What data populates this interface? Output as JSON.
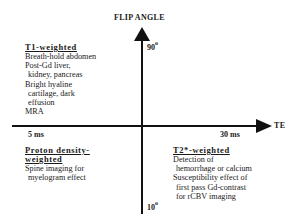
{
  "diagram": {
    "y_axis": {
      "label": "FLIP ANGLE",
      "top_tick": "90",
      "bottom_tick": "10",
      "tick_unit": "o"
    },
    "x_axis": {
      "label": "TE",
      "left_tick": "5 ms",
      "right_tick": "30 ms"
    },
    "quadrants": {
      "top_left": {
        "title": "T1-weighted",
        "lines": [
          "Breath-hold abdomen",
          "Post-Gd liver,",
          "kidney, pancreas",
          "Bright hyaline",
          "cartilage, dark",
          "effusion",
          "MRA"
        ]
      },
      "bottom_left": {
        "title_line1": "Proton density-",
        "title_line2": "weighted",
        "lines": [
          "Spine imaging for",
          "myelogram effect"
        ]
      },
      "bottom_right": {
        "title": "T2*-weighted",
        "lines": [
          "Detection of",
          "hemorrhage or calcium",
          "Susceptibility effect of",
          "first pass Gd-contrast",
          "for rCBV imaging"
        ]
      }
    },
    "colors": {
      "axis": "#111111",
      "text": "#1a1a1a",
      "background": "#ffffff"
    }
  }
}
